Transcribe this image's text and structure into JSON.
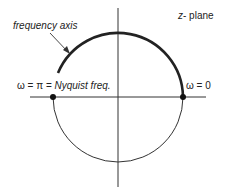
{
  "diagram": {
    "title_var": "z",
    "title_rest": "- plane",
    "arrow_label": "frequency axis",
    "left_point_prefix": "ω = π = ",
    "left_point_label": "Nyquist freq.",
    "right_point_label": "ω = 0",
    "colors": {
      "stroke": "#222222",
      "background": "#ffffff"
    }
  }
}
